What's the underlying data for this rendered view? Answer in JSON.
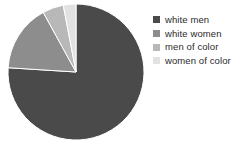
{
  "chart_data": {
    "type": "pie",
    "title": "",
    "categories": [
      "white men",
      "white women",
      "men of color",
      "women of color"
    ],
    "values": [
      76,
      16,
      5,
      3
    ],
    "unit": "percent",
    "colors": [
      "#4a4a4a",
      "#8d8d8d",
      "#b8b8b8",
      "#e2e2e2"
    ],
    "legend_position": "right",
    "start_angle_deg": 0,
    "direction": "clockwise",
    "grid": false,
    "slices": [
      {
        "label": "white men",
        "value": 76,
        "color": "#4a4a4a",
        "start_deg": 0,
        "end_deg": 273.6
      },
      {
        "label": "white women",
        "value": 16,
        "color": "#8d8d8d",
        "start_deg": 273.6,
        "end_deg": 331.2
      },
      {
        "label": "men of color",
        "value": 5,
        "color": "#b8b8b8",
        "start_deg": 331.2,
        "end_deg": 349.2
      },
      {
        "label": "women of color",
        "value": 3,
        "color": "#e2e2e2",
        "start_deg": 349.2,
        "end_deg": 360
      }
    ]
  },
  "legend": {
    "items": [
      {
        "label": "white men",
        "color": "#4a4a4a",
        "swatch_name": "legend-swatch-white-men"
      },
      {
        "label": "white women",
        "color": "#8d8d8d",
        "swatch_name": "legend-swatch-white-women"
      },
      {
        "label": "men of color",
        "color": "#b8b8b8",
        "swatch_name": "legend-swatch-men-of-color"
      },
      {
        "label": "women of color",
        "color": "#e2e2e2",
        "swatch_name": "legend-swatch-women-of-color"
      }
    ]
  },
  "pie_geometry": {
    "center_x": 76,
    "center_y": 72,
    "radius": 68,
    "outline_color": "#ffffff"
  }
}
